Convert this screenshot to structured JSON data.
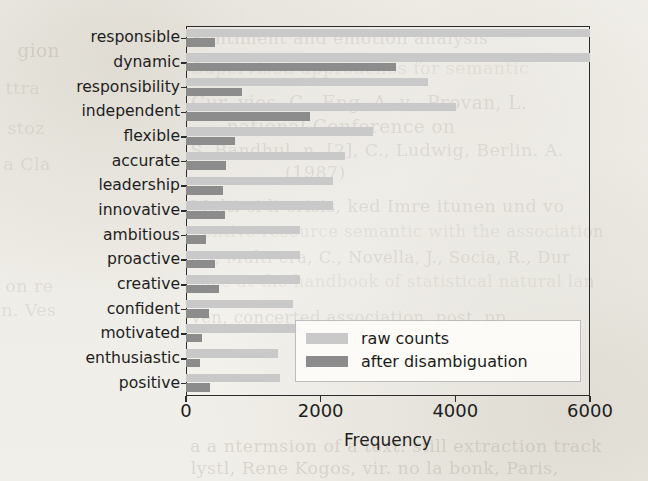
{
  "page": {
    "background_color": "#f2f0eb",
    "ghost_text": [
      {
        "text": "Sentiment and emotion analysis",
        "x": 196,
        "y": 28,
        "size": 17,
        "class": "faint"
      },
      {
        "text": "gion",
        "x": 18,
        "y": 40,
        "size": 18,
        "class": "faint"
      },
      {
        "text": "Supervised approaches for semantic",
        "x": 196,
        "y": 58,
        "size": 17,
        "class": "faintest"
      },
      {
        "text": "ttra",
        "x": 6,
        "y": 78,
        "size": 17,
        "class": "faintest"
      },
      {
        "text": "Cur, vies, C., Eng, A. v., Provan, L.",
        "x": 196,
        "y": 92,
        "size": 18,
        "class": "faint"
      },
      {
        "text": "national Conference on",
        "x": 230,
        "y": 116,
        "size": 18,
        "class": "faint"
      },
      {
        "text": "stoz",
        "x": 8,
        "y": 118,
        "size": 17,
        "class": "faintest"
      },
      {
        "text": "S. Bandhul, n. [2], C., Ludwig, Berlin. A.",
        "x": 196,
        "y": 140,
        "size": 17,
        "class": "faint"
      },
      {
        "text": "a Cla",
        "x": 4,
        "y": 154,
        "size": 17,
        "class": "faintest"
      },
      {
        "text": "(1987)",
        "x": 286,
        "y": 162,
        "size": 17,
        "class": "faint"
      },
      {
        "text": "Multi-si li crisis, ked Imre itunen und vo",
        "x": 196,
        "y": 196,
        "size": 17,
        "class": "faint"
      },
      {
        "text": "entive resource semantic with the association",
        "x": 208,
        "y": 222,
        "size": 16,
        "class": "faintest"
      },
      {
        "text": "ics, Multi-era, C., Novella, J., Socia, R., Dur",
        "x": 196,
        "y": 248,
        "size": 16,
        "class": "faint"
      },
      {
        "text": "ence at the handbook of statistical natural lan",
        "x": 196,
        "y": 272,
        "size": 16,
        "class": "faintest"
      },
      {
        "text": "on re",
        "x": 6,
        "y": 276,
        "size": 17,
        "class": "faintest"
      },
      {
        "text": "n. Ves",
        "x": 2,
        "y": 300,
        "size": 17,
        "class": "faintest"
      },
      {
        "text": "ven, concerted association, post, pp",
        "x": 196,
        "y": 308,
        "size": 16,
        "class": "faint"
      },
      {
        "text": "a a ntermsion of a text: still extraction track",
        "x": 196,
        "y": 436,
        "size": 17,
        "class": "faint"
      },
      {
        "text": "lystl, Rene Kogos, vir. no la bonk, Paris,",
        "x": 196,
        "y": 458,
        "size": 17,
        "class": "faint"
      }
    ]
  },
  "chart_data": {
    "type": "bar",
    "orientation": "horizontal",
    "title": "",
    "xlabel": "Frequency",
    "ylabel": "",
    "xlim": [
      0,
      6000
    ],
    "xticks": [
      0,
      2000,
      4000,
      6000
    ],
    "xtick_labels": [
      "0",
      "2000",
      "4000",
      "6000"
    ],
    "grid": false,
    "legend_position": "center right",
    "categories": [
      "responsible",
      "dynamic",
      "responsibility",
      "independent",
      "flexible",
      "accurate",
      "leadership",
      "innovative",
      "ambitious",
      "proactive",
      "creative",
      "confident",
      "motivated",
      "enthusiastic",
      "positive"
    ],
    "series": [
      {
        "name": "raw counts",
        "color": "#c9c9c9",
        "values": [
          6000,
          6000,
          3590,
          4010,
          2780,
          2360,
          2190,
          2190,
          1700,
          1690,
          1690,
          1590,
          1700,
          1370,
          1400
        ]
      },
      {
        "name": "after disambiguation",
        "color": "#8c8c8c",
        "values": [
          430,
          3120,
          830,
          1840,
          730,
          595,
          550,
          580,
          290,
          430,
          490,
          340,
          240,
          210,
          360
        ]
      }
    ]
  },
  "legend": {
    "entries": [
      {
        "label": "raw counts",
        "swatch": "light"
      },
      {
        "label": "after disambiguation",
        "swatch": "dark"
      }
    ]
  }
}
